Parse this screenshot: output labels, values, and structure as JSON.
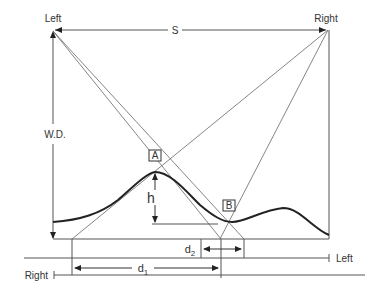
{
  "diagram": {
    "type": "stereo parallax geometry",
    "labels": {
      "left_camera": "Left",
      "right_camera": "Right",
      "baseline_s": "S",
      "working_distance": "W.D.",
      "point_a": "A",
      "point_b": "B",
      "height": "h",
      "d1": "d",
      "d1_sub": "1",
      "d2": "d",
      "d2_sub": "2",
      "left_axis": "Left",
      "right_axis": "Right"
    },
    "colors": {
      "line": "#555555",
      "curve": "#222222",
      "text": "#333333",
      "background": "#ffffff"
    }
  }
}
